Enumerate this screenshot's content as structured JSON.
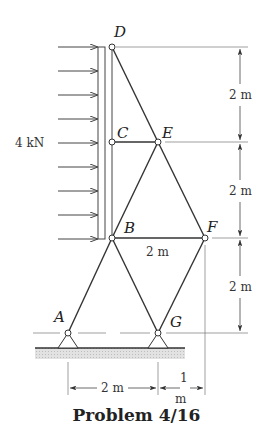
{
  "figure": {
    "caption": "Problem 4/16",
    "load_label": "4 kN",
    "joints": {
      "A": "A",
      "B": "B",
      "C": "C",
      "D": "D",
      "E": "E",
      "F": "F",
      "G": "G"
    },
    "dimensions": {
      "vertical_1": "2 m",
      "vertical_2": "2 m",
      "vertical_3": "2 m",
      "bf_span": "2 m",
      "ag_span": "2 m",
      "g_offset_num": "1",
      "g_offset_unit": "m"
    },
    "load_arrow_count": 9,
    "colors": {
      "line": "#333333",
      "ground_hatch": "#cfcfcf"
    }
  }
}
